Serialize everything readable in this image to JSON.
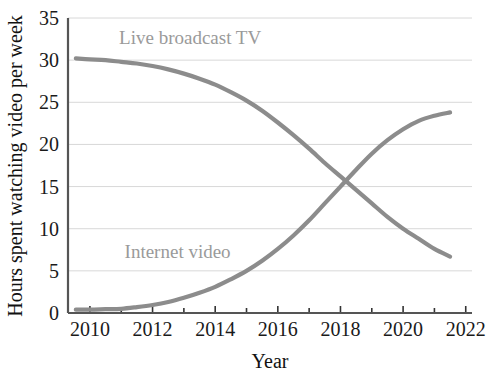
{
  "chart_data": {
    "type": "line",
    "title": "",
    "xlabel": "Year",
    "ylabel": "Hours spent watching video per week",
    "xlim": [
      2009.3,
      2022.2
    ],
    "ylim": [
      0,
      35
    ],
    "grid": true,
    "legend_position": "inline-annotations",
    "x_ticks": [
      2010,
      2012,
      2014,
      2016,
      2018,
      2020,
      2022
    ],
    "x_tick_labels": [
      "2010",
      "2012",
      "2014",
      "2016",
      "2018",
      "2020",
      "2022"
    ],
    "x_minor_ticks": [
      2011,
      2013,
      2015,
      2017,
      2019,
      2021
    ],
    "y_ticks": [
      0,
      5,
      10,
      15,
      20,
      25,
      30,
      35
    ],
    "y_tick_labels": [
      "0",
      "5",
      "10",
      "15",
      "20",
      "25",
      "30",
      "35"
    ],
    "series": [
      {
        "name": "Live broadcast TV",
        "color": "#8c8c8c",
        "label_x": 2013.2,
        "label_y": 32.6,
        "x": [
          2009.55,
          2010,
          2010.5,
          2011,
          2011.5,
          2012,
          2012.5,
          2013,
          2013.5,
          2014,
          2014.5,
          2015,
          2015.5,
          2016,
          2016.5,
          2017,
          2017.5,
          2018,
          2018.5,
          2019,
          2019.5,
          2020,
          2020.5,
          2021,
          2021.5
        ],
        "y": [
          30.2,
          30.1,
          30.0,
          29.8,
          29.6,
          29.3,
          28.9,
          28.4,
          27.8,
          27.1,
          26.2,
          25.2,
          24.0,
          22.6,
          21.1,
          19.5,
          17.8,
          16.2,
          14.6,
          13.0,
          11.4,
          10.0,
          8.8,
          7.6,
          6.7
        ]
      },
      {
        "name": "Internet video",
        "color": "#8c8c8c",
        "label_x": 2012.8,
        "label_y": 7.2,
        "x": [
          2009.55,
          2010,
          2010.5,
          2011,
          2011.5,
          2012,
          2012.5,
          2013,
          2013.5,
          2014,
          2014.5,
          2015,
          2015.5,
          2016,
          2016.5,
          2017,
          2017.5,
          2018,
          2018.5,
          2019,
          2019.5,
          2020,
          2020.5,
          2021,
          2021.5
        ],
        "y": [
          0.4,
          0.4,
          0.45,
          0.5,
          0.7,
          0.95,
          1.3,
          1.8,
          2.4,
          3.1,
          4.0,
          5.0,
          6.2,
          7.6,
          9.2,
          11.0,
          13.0,
          15.0,
          17.0,
          18.9,
          20.5,
          21.8,
          22.8,
          23.4,
          23.8
        ]
      }
    ],
    "crossing_point": {
      "x": 2018.8,
      "y": 15.0
    }
  },
  "colors": {
    "series_gray": "#8c8c8c",
    "gridline": "#d8d8d8",
    "axis": "#555555",
    "text": "#1a1a1a",
    "label_gray": "#9a9a9a",
    "background": "#ffffff"
  }
}
